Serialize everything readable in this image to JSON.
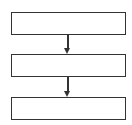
{
  "diagram": {
    "type": "flowchart",
    "direction": "top-to-bottom",
    "nodes": [
      {
        "id": "step-1",
        "label": ""
      },
      {
        "id": "step-2",
        "label": ""
      },
      {
        "id": "step-3",
        "label": ""
      }
    ],
    "edges": [
      {
        "from": "step-1",
        "to": "step-2"
      },
      {
        "from": "step-2",
        "to": "step-3"
      }
    ],
    "colors": {
      "stroke": "#333333",
      "background": "#ffffff"
    }
  }
}
